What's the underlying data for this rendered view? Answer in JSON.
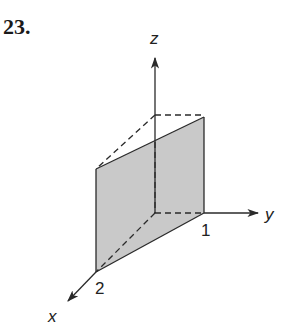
{
  "problem": {
    "number": "23."
  },
  "axes": {
    "x": {
      "label": "x"
    },
    "y": {
      "label": "y"
    },
    "z": {
      "label": "z"
    }
  },
  "ticks": {
    "y_intercept": "1",
    "x_intercept": "2"
  },
  "colors": {
    "plane_fill": "#c8c8c8",
    "line": "#2a2a2a"
  }
}
